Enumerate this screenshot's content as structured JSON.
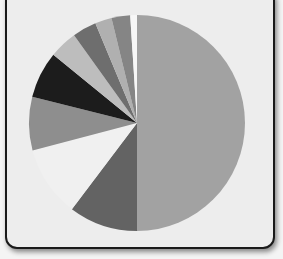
{
  "chart_data": {
    "type": "pie",
    "title": "",
    "legend": [],
    "center": [
      137,
      123
    ],
    "radius": 108,
    "start_angle_deg": 0,
    "direction": "clockwise",
    "slices": [
      {
        "label": "",
        "value": 50.0,
        "color": "#a2a2a2"
      },
      {
        "label": "",
        "value": 10.3,
        "color": "#636363"
      },
      {
        "label": "",
        "value": 10.6,
        "color": "#f0f0f0",
        "note": "gap / missing slice"
      },
      {
        "label": "",
        "value": 8.0,
        "color": "#8e8e8e"
      },
      {
        "label": "",
        "value": 7.0,
        "color": "#1c1c1c"
      },
      {
        "label": "",
        "value": 4.2,
        "color": "#bdbdbd"
      },
      {
        "label": "",
        "value": 3.6,
        "color": "#6e6e6e"
      },
      {
        "label": "",
        "value": 2.5,
        "color": "#b0b0b0"
      },
      {
        "label": "",
        "value": 2.8,
        "color": "#858585"
      },
      {
        "label": "",
        "value": 1.0,
        "color": "#f7f7f7",
        "note": "thin white gap"
      }
    ]
  }
}
